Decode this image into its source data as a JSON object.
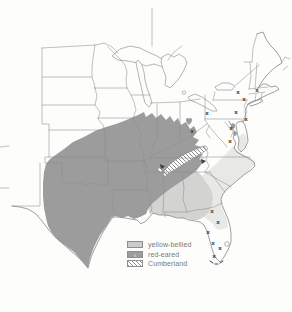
{
  "map": {
    "mark_symbol": "x",
    "colors": {
      "background": "#fdfdfb",
      "outline": "#8e8e8e",
      "red_eared": "#9c9c9c",
      "yellow_bellied": "#e8e8e6",
      "intergrade": "#d3d3d1",
      "cumberland_hatch": "#6f6f6f",
      "legend_yellow_swatch": "#cbcbcb",
      "mark_color": "#3f3f3f",
      "label_color": "#7a7a74"
    },
    "introduced_marks": [
      {
        "x": 207,
        "y": 113
      },
      {
        "x": 192,
        "y": 131
      },
      {
        "x": 238,
        "y": 92
      },
      {
        "x": 257,
        "y": 90
      },
      {
        "x": 244,
        "y": 99
      },
      {
        "x": 236,
        "y": 112
      },
      {
        "x": 246,
        "y": 119
      },
      {
        "x": 231,
        "y": 128
      },
      {
        "x": 230,
        "y": 141
      },
      {
        "x": 212,
        "y": 211
      },
      {
        "x": 218,
        "y": 222
      },
      {
        "x": 208,
        "y": 232
      },
      {
        "x": 213,
        "y": 243
      },
      {
        "x": 220,
        "y": 248
      },
      {
        "x": 214,
        "y": 256
      }
    ]
  },
  "legend": {
    "items": [
      {
        "label": "yellow-bellied"
      },
      {
        "label": "red-eared"
      },
      {
        "label": "Cumberland"
      }
    ]
  }
}
